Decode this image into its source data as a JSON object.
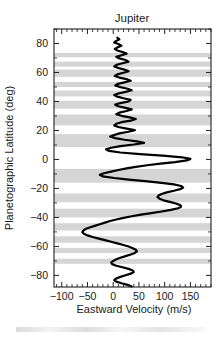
{
  "figure": {
    "title": "Jupiter",
    "caption_partial": ""
  },
  "axes": {
    "x_title": "Eastward Velocity (m/s)",
    "y_title": "Planetographic Latitude (deg)",
    "x_ticklabels": [
      "-100",
      "-50",
      "0",
      "50",
      "100",
      "150"
    ],
    "y_ticklabels": [
      "80",
      "60",
      "40",
      "20",
      "0",
      "-20",
      "-40",
      "-60",
      "-80"
    ]
  },
  "chart_data": {
    "type": "line",
    "title": "Jupiter",
    "xlabel": "Eastward Velocity (m/s)",
    "ylabel": "Planetographic Latitude (deg)",
    "xlim": [
      -115,
      190
    ],
    "ylim": [
      -88,
      90
    ],
    "xticks": [
      -100,
      -50,
      0,
      50,
      100,
      150
    ],
    "yticks": [
      80,
      60,
      40,
      20,
      0,
      -20,
      -40,
      -60,
      -80
    ],
    "x_minor_per_major": 5,
    "y_minor_per_major": 2,
    "grid": false,
    "legend": null,
    "orientation": "x-is-velocity, y-is-latitude",
    "series": [
      {
        "name": "Eastward Velocity",
        "color": "#000000",
        "x": [
          8,
          12,
          6,
          2,
          10,
          16,
          9,
          3,
          8,
          18,
          26,
          16,
          6,
          12,
          24,
          30,
          18,
          7,
          2,
          10,
          22,
          30,
          20,
          8,
          3,
          12,
          26,
          34,
          22,
          9,
          4,
          14,
          28,
          36,
          24,
          10,
          2,
          8,
          20,
          34,
          30,
          14,
          4,
          10,
          24,
          36,
          26,
          12,
          6,
          16,
          32,
          44,
          34,
          16,
          6,
          2,
          10,
          26,
          42,
          30,
          12,
          2,
          -6,
          4,
          22,
          46,
          60,
          40,
          14,
          -4,
          -14,
          -8,
          14,
          52,
          96,
          134,
          150,
          143,
          120,
          92,
          66,
          44,
          26,
          10,
          -4,
          -18,
          -26,
          -20,
          2,
          30,
          62,
          94,
          118,
          132,
          136,
          130,
          118,
          104,
          94,
          88,
          86,
          90,
          98,
          110,
          122,
          130,
          132,
          126,
          112,
          94,
          74,
          54,
          36,
          20,
          6,
          -6,
          -16,
          -26,
          -36,
          -46,
          -54,
          -58,
          -60,
          -57,
          -50,
          -40,
          -28,
          -16,
          -4,
          8,
          20,
          30,
          38,
          44,
          46,
          42,
          34,
          24,
          14,
          6,
          0,
          -4,
          -2,
          6,
          18,
          30,
          38,
          40,
          34,
          24,
          14,
          6,
          2,
          6,
          16,
          28,
          36,
          38,
          32,
          22,
          12,
          4,
          0,
          4,
          14,
          26,
          34,
          36,
          30,
          20,
          10,
          2,
          -2,
          2,
          12,
          24,
          32,
          34,
          28,
          18,
          8,
          2,
          -2,
          4,
          14,
          24,
          30,
          30,
          24,
          14,
          6,
          0,
          -2,
          4,
          12,
          22,
          28,
          28,
          22,
          12,
          4,
          -2,
          -4,
          2,
          10,
          20,
          26,
          26,
          20,
          10,
          2,
          -2,
          -2,
          4,
          12,
          20,
          24,
          22,
          16,
          8,
          2,
          -2,
          0,
          6,
          14,
          20,
          22,
          18,
          12,
          6,
          2,
          2,
          6,
          12,
          18,
          20,
          16,
          10,
          4,
          2,
          4,
          8,
          12,
          14,
          12,
          8,
          6,
          8,
          12,
          14,
          12,
          8,
          6,
          8,
          10,
          10,
          8,
          8,
          10,
          10
        ],
        "y": [
          84.0,
          82.9,
          81.8,
          80.7,
          79.6,
          78.5,
          77.4,
          76.3,
          75.2,
          74.1,
          73.0,
          71.9,
          70.8,
          69.7,
          68.6,
          67.5,
          66.4,
          65.3,
          64.2,
          63.1,
          62.0,
          60.9,
          59.8,
          58.7,
          57.6,
          56.5,
          55.4,
          54.3,
          53.2,
          52.1,
          51.0,
          49.9,
          48.8,
          47.7,
          46.6,
          45.5,
          44.4,
          43.3,
          42.2,
          41.1,
          40.0,
          38.9,
          37.8,
          36.7,
          35.6,
          34.5,
          33.4,
          32.3,
          31.2,
          30.1,
          29.0,
          27.9,
          26.8,
          25.7,
          24.6,
          23.5,
          22.4,
          21.3,
          20.2,
          19.1,
          18.0,
          16.9,
          15.8,
          14.7,
          13.6,
          12.5,
          11.4,
          10.3,
          9.2,
          8.1,
          7.0,
          5.9,
          4.8,
          3.7,
          2.6,
          1.5,
          0.4,
          -0.7,
          -1.8,
          -2.9,
          -4.0,
          -5.1,
          -6.2,
          -7.3,
          -8.4,
          -9.5,
          -10.6,
          -11.7,
          -12.8,
          -13.9,
          -15.0,
          -16.1,
          -17.2,
          -18.3,
          -19.4,
          -20.5,
          -21.6,
          -22.7,
          -23.8,
          -24.9,
          -26.0,
          -27.1,
          -28.2,
          -29.3,
          -30.4,
          -31.5,
          -32.6,
          -33.7,
          -34.8,
          -35.9,
          -37.0,
          -38.1,
          -39.2,
          -40.3,
          -41.4,
          -42.5,
          -43.6,
          -44.7,
          -45.8,
          -46.9,
          -48.0,
          -49.1,
          -50.2,
          -51.3,
          -52.4,
          -53.5,
          -54.6,
          -55.7,
          -56.8,
          -57.9,
          -59.0,
          -60.1,
          -61.2,
          -62.3,
          -63.4,
          -64.5,
          -65.6,
          -66.7,
          -67.8,
          -68.9,
          -70.0,
          -71.1,
          -72.2,
          -73.3,
          -74.4,
          -75.5,
          -76.6,
          -77.7,
          -78.8,
          -79.9,
          -81.0,
          -82.1,
          -83.2,
          -84.3,
          -85.4,
          -86.5,
          -87.6,
          -88.7,
          -89.8,
          -90.9,
          -92.0,
          -93.1,
          -94.2,
          -95.3,
          -96.4,
          -97.5,
          -98.6,
          -99.7,
          -100.8,
          -101.9,
          -103.0,
          -104.1,
          -105.2,
          -106.3,
          -107.4,
          -108.5,
          -109.6,
          -110.7,
          -111.8,
          -112.9,
          -114.0,
          -115.1,
          -116.2,
          -117.3,
          -118.4,
          -119.5,
          -120.6,
          -121.7,
          -122.8,
          -123.9,
          -125.0,
          -126.1,
          -127.2,
          -128.3,
          -129.4,
          -130.5,
          -131.6,
          -132.7,
          -133.8,
          -134.9,
          -136.0,
          -137.1,
          -138.2,
          -139.3,
          -140.4,
          -141.5,
          -142.6,
          -143.7,
          -144.8,
          -145.9,
          -147.0,
          -148.1,
          -149.2,
          -150.3,
          -151.4,
          -152.5,
          -153.6,
          -154.7,
          -155.8,
          -156.9,
          -158.0,
          -159.1,
          -160.2,
          -161.3,
          -162.4,
          -163.5,
          -164.6,
          -165.7,
          -166.8,
          -167.9,
          -169.0,
          -170.1,
          -171.2,
          -172.3,
          -173.4,
          -174.5,
          -175.6,
          -176.7,
          -177.8,
          -178.9,
          -180.0,
          -181.1,
          -182.2,
          -183.3,
          -184.4,
          -185.5,
          -186.6,
          -187.7,
          -188.8,
          -189.9,
          -191.0,
          -192.1,
          -193.2,
          -194.3,
          -195.4,
          -196.5,
          -197.6,
          -198.7,
          -199.8,
          -200.9
        ]
      }
    ],
    "shaded_bands": {
      "description": "Horizontal grey bands spanning full plot width marking Jupiter's dark belts",
      "color": "#cfcfcf",
      "latitude_ranges": [
        [
          70.5,
          73.5
        ],
        [
          64.0,
          67.5
        ],
        [
          57.0,
          62.0
        ],
        [
          50.0,
          53.5
        ],
        [
          43.5,
          47.5
        ],
        [
          35.0,
          40.5
        ],
        [
          23.5,
          31.0
        ],
        [
          8.5,
          17.5
        ],
        [
          -16.0,
          -6.5
        ],
        [
          -29.5,
          -23.5
        ],
        [
          -40.0,
          -34.0
        ],
        [
          -49.0,
          -44.0
        ],
        [
          -57.5,
          -53.0
        ],
        [
          -64.5,
          -61.0
        ],
        [
          -72.0,
          -68.5
        ]
      ]
    }
  }
}
